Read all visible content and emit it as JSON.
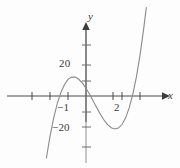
{
  "chart_data": {
    "type": "line",
    "title": "",
    "xlabel": "x",
    "ylabel": "y",
    "grid": false,
    "legend_position": "none",
    "xlim": [
      -2.2,
      3.6
    ],
    "ylim": [
      -38,
      42
    ],
    "x_ticks": [
      -2.0,
      -1.5,
      -1.0,
      -0.5,
      0.5,
      1.0,
      1.5,
      2.0,
      2.5,
      3.0
    ],
    "x_tick_labels": [
      {
        "value": -1,
        "text": "−1"
      },
      {
        "value": 2,
        "text": "2"
      }
    ],
    "y_ticks": [
      -30,
      -20,
      -10,
      10,
      20,
      30
    ],
    "y_tick_labels": [
      {
        "value": 20,
        "text": "20"
      },
      {
        "value": -20,
        "text": "−20"
      }
    ],
    "curve_color": "#8a8a8a",
    "axis_color": "#4a4a4a",
    "series": [
      {
        "name": "cubic",
        "description": "cubic polynomial with local maximum near x=-0.8 and local minimum near x=1.9",
        "x_intercepts": [
          -1.55,
          0.42,
          2.95
        ],
        "local_maximum": {
          "x": -0.8,
          "y": 12
        },
        "local_minimum": {
          "x": 1.9,
          "y": -16
        },
        "y_intercept": 6,
        "points": [
          {
            "x": -2.2,
            "y": -40.0
          },
          {
            "x": -2.0,
            "y": -26.0
          },
          {
            "x": -1.8,
            "y": -14.4
          },
          {
            "x": -1.6,
            "y": -5.1
          },
          {
            "x": -1.4,
            "y": 2.1
          },
          {
            "x": -1.2,
            "y": 7.3
          },
          {
            "x": -1.0,
            "y": 10.7
          },
          {
            "x": -0.8,
            "y": 12.2
          },
          {
            "x": -0.6,
            "y": 12.2
          },
          {
            "x": -0.4,
            "y": 10.8
          },
          {
            "x": -0.2,
            "y": 8.3
          },
          {
            "x": 0.0,
            "y": 5.0
          },
          {
            "x": 0.2,
            "y": 1.1
          },
          {
            "x": 0.4,
            "y": -3.2
          },
          {
            "x": 0.6,
            "y": -7.6
          },
          {
            "x": 0.8,
            "y": -11.8
          },
          {
            "x": 1.0,
            "y": -15.5
          },
          {
            "x": 1.2,
            "y": -18.5
          },
          {
            "x": 1.4,
            "y": -20.5
          },
          {
            "x": 1.6,
            "y": -21.3
          },
          {
            "x": 1.8,
            "y": -20.7
          },
          {
            "x": 2.0,
            "y": -18.4
          },
          {
            "x": 2.2,
            "y": -14.1
          },
          {
            "x": 2.4,
            "y": -7.7
          },
          {
            "x": 2.6,
            "y": 1.1
          },
          {
            "x": 2.8,
            "y": 12.3
          },
          {
            "x": 3.0,
            "y": 26.2
          },
          {
            "x": 3.2,
            "y": 43.0
          },
          {
            "x": 3.35,
            "y": 57.0
          }
        ]
      }
    ]
  },
  "axes": {
    "y_axis_name": "y",
    "x_axis_name": "x"
  },
  "labels": {
    "y_pos_20": "20",
    "y_neg_20": "−20",
    "x_neg_1": "−1",
    "x_2": "2"
  }
}
